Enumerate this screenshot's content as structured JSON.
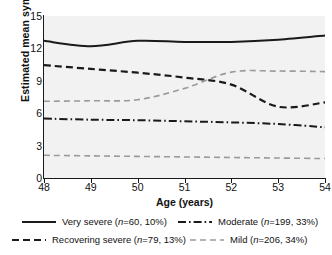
{
  "chart_data": {
    "type": "line",
    "title": "",
    "subtitle": "",
    "xlabel": "Age (years)",
    "ylabel": "Estimated mean symptom score",
    "xlim": [
      48,
      54
    ],
    "ylim": [
      0,
      15
    ],
    "xticks": [
      48,
      49,
      50,
      51,
      52,
      53,
      54
    ],
    "xticklabels": [
      "48",
      "49",
      "50",
      "51",
      "52",
      "53",
      "54"
    ],
    "yticks": [
      0,
      3,
      6,
      9,
      12,
      15
    ],
    "yticklabels": [
      "0",
      "3",
      "6",
      "9",
      "12",
      "15"
    ],
    "grid": false,
    "plot_background": "#f2f2f2",
    "legend_position": "below",
    "x": [
      48,
      49,
      50,
      51,
      52,
      53,
      54
    ],
    "series": [
      {
        "name": "Very severe",
        "legend_label": "Very severe (n=60, 10%)",
        "n": 60,
        "percent": "10%",
        "style": "solid",
        "color": "#1a1a1a",
        "width": 2.0,
        "values": [
          12.7,
          12.2,
          12.7,
          12.6,
          12.6,
          12.8,
          13.2
        ]
      },
      {
        "name": "Recovering severe",
        "legend_label": "Recovering severe (n=79, 13%)",
        "n": 79,
        "percent": "13%",
        "style": "dashed",
        "color": "#1a1a1a",
        "width": 2.2,
        "values": [
          10.45,
          10.1,
          9.75,
          9.3,
          8.65,
          6.6,
          7.0
        ]
      },
      {
        "name": "Moderate",
        "legend_label": "Moderate (n=199, 33%)",
        "n": 199,
        "percent": "33%",
        "style": "dashdot",
        "color": "#1a1a1a",
        "width": 2.0,
        "values": [
          5.5,
          5.4,
          5.35,
          5.25,
          5.15,
          5.0,
          4.7
        ]
      },
      {
        "name": "Mild",
        "legend_label": "Mild (n=206, 34%)",
        "n": 206,
        "percent": "34%",
        "style": "dashed-light",
        "color": "#9a9a9a",
        "width": 1.6,
        "values": [
          7.1,
          7.15,
          7.25,
          8.3,
          9.8,
          9.9,
          9.85
        ]
      },
      {
        "name": "Recovered",
        "legend_label": "",
        "n": null,
        "percent": "",
        "style": "dashed-light",
        "color": "#9a9a9a",
        "width": 1.6,
        "values": [
          2.1,
          2.05,
          2.0,
          1.95,
          1.9,
          1.85,
          1.8
        ]
      }
    ]
  },
  "axes": {
    "y_title": "Estimated mean symptom score",
    "x_title": "Age (years)"
  },
  "legend": {
    "items": [
      {
        "label": "Very severe (n=60, 10%)",
        "name_part": "Very severe (",
        "n_part": "n",
        "val_part": "=60, 10%)"
      },
      {
        "label": "Recovering severe (n=79, 13%)",
        "name_part": "Recovering severe (",
        "n_part": "n",
        "val_part": "=79, 13%)"
      },
      {
        "label": "Moderate (n=199, 33%)",
        "name_part": "Moderate (",
        "n_part": "n",
        "val_part": "=199, 33%)"
      },
      {
        "label": "Mild (n=206, 34%)",
        "name_part": "Mild (",
        "n_part": "n",
        "val_part": "=206, 34%)"
      }
    ]
  }
}
